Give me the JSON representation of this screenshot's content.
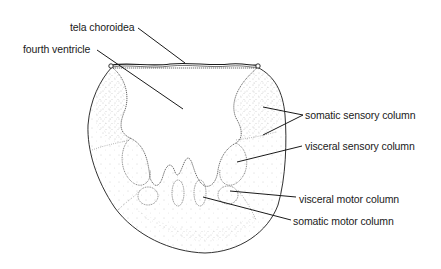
{
  "diagram": {
    "labels": {
      "tela_choroidea": "tela choroidea",
      "fourth_ventricle": "fourth ventricle",
      "somatic_sensory_column": "somatic sensory column",
      "visceral_sensory_column": "visceral sensory column",
      "visceral_motor_column": "visceral motor column",
      "somatic_motor_column": "somatic motor column"
    },
    "colors": {
      "ink": "#1a1a1a",
      "stipple": "#555555",
      "background": "#ffffff"
    }
  }
}
